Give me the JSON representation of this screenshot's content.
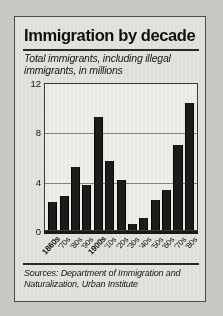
{
  "figure": {
    "title": "Immigration by decade",
    "subtitle": "Total immigrants, including illegal immigrants, in millions",
    "source": "Sources: Department of Immigration and Naturalization, Urban Institute"
  },
  "chart_data": {
    "type": "bar",
    "title": "Immigration by decade",
    "subtitle": "Total immigrants, including illegal immigrants, in millions",
    "xlabel": "",
    "ylabel": "millions",
    "ylim": [
      0,
      12
    ],
    "yticks": [
      0,
      4,
      8,
      12
    ],
    "ytick_labels": [
      "0",
      "4",
      "8",
      "12"
    ],
    "grid": true,
    "legend": false,
    "categories": [
      "1860s",
      "'70s",
      "'80s",
      "'90s",
      "1900s",
      "'10s",
      "'20s",
      "'30s",
      "'40s",
      "'50s",
      "'60s",
      "'70s",
      "'80s"
    ],
    "values": [
      2.3,
      2.8,
      5.2,
      3.7,
      9.3,
      5.7,
      4.1,
      0.5,
      1.0,
      2.5,
      3.3,
      7.0,
      10.4
    ],
    "bar_color": "#1d1c1a",
    "annotations": [
      "Sources: Department of Immigration and Naturalization, Urban Institute"
    ]
  }
}
